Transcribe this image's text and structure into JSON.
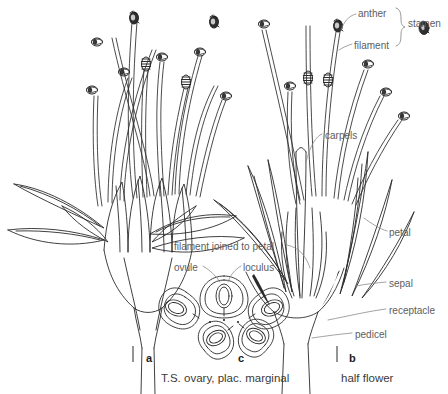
{
  "figure": {
    "kind": "botanical-line-drawing",
    "background_color": "#ffffff",
    "ink_color": "#2a2a2a",
    "label_color": "#5d5d5d"
  },
  "annotations": [
    {
      "id": "anther",
      "text": "anther",
      "x": 358,
      "y": 8,
      "leader": true
    },
    {
      "id": "filament",
      "text": "filament",
      "x": 354,
      "y": 40,
      "leader": true
    },
    {
      "id": "stamen",
      "text": "stamen",
      "x": 408,
      "y": 18,
      "leader": false
    },
    {
      "id": "carpels",
      "text": "carpels",
      "x": 325,
      "y": 130,
      "leader": true
    },
    {
      "id": "petal",
      "text": "petal",
      "x": 389,
      "y": 227,
      "leader": true
    },
    {
      "id": "filament-joined-to-petal",
      "text": "filament joined to petal",
      "x": 174,
      "y": 241,
      "leader": true
    },
    {
      "id": "ovule",
      "text": "ovule",
      "x": 174,
      "y": 262,
      "leader": true
    },
    {
      "id": "loculus",
      "text": "loculus",
      "x": 243,
      "y": 262,
      "leader": true
    },
    {
      "id": "sepal",
      "text": "sepal",
      "x": 389,
      "y": 278,
      "leader": true
    },
    {
      "id": "receptacle",
      "text": "receptacle",
      "x": 389,
      "y": 305,
      "leader": true
    },
    {
      "id": "pedicel",
      "text": "pedicel",
      "x": 355,
      "y": 329,
      "leader": true
    }
  ],
  "figure_labels": [
    {
      "id": "a",
      "text": "a",
      "x": 146,
      "y": 352
    },
    {
      "id": "c",
      "text": "c",
      "x": 238,
      "y": 352
    },
    {
      "id": "b",
      "text": "b",
      "x": 349,
      "y": 352
    }
  ],
  "captions": [
    {
      "id": "caption-c",
      "text": "T.S. ovary, plac. marginal",
      "x": 161,
      "y": 372
    },
    {
      "id": "caption-b",
      "text": "half flower",
      "x": 341,
      "y": 372
    }
  ]
}
